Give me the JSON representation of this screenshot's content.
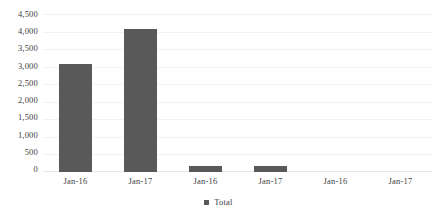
{
  "chart_data": {
    "type": "bar",
    "title": "",
    "xlabel": "",
    "ylabel": "",
    "categories": [
      "Jan-16",
      "Jan-17",
      "Jan-16",
      "Jan-17",
      "Jan-16",
      "Jan-17"
    ],
    "series": [
      {
        "name": "Total",
        "values": [
          3080,
          4060,
          180,
          180,
          0,
          0
        ],
        "color": "#595959"
      }
    ],
    "ylim": [
      0,
      4500
    ],
    "ytick_step": 500,
    "ytick_labels": [
      "4,500",
      "4,000",
      "3,500",
      "3,000",
      "2,500",
      "2,000",
      "1,500",
      "1,000",
      "500",
      "0"
    ],
    "ytick_values": [
      4500,
      4000,
      3500,
      3000,
      2500,
      2000,
      1500,
      1000,
      500,
      0
    ],
    "grid": true,
    "grid_color": "#f2f2f2",
    "legend": {
      "position": "bottom",
      "entries": [
        {
          "label": "Total",
          "color": "#595959",
          "marker": "square"
        }
      ]
    },
    "background": "#ffffff"
  }
}
